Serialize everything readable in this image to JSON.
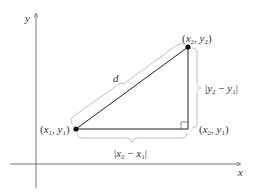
{
  "diagram": {
    "axes": {
      "x_label": "x",
      "y_label": "y"
    },
    "points": {
      "p1": {
        "label_open": "(",
        "x_base": "x",
        "x_sub": "1",
        "comma": ", ",
        "y_base": "y",
        "y_sub": "1",
        "label_close": ")"
      },
      "p2": {
        "label_open": "(",
        "x_base": "x",
        "x_sub": "2",
        "comma": ", ",
        "y_base": "y",
        "y_sub": "2",
        "label_close": ")"
      },
      "corner": {
        "label_open": "(",
        "x_base": "x",
        "x_sub": "2",
        "comma": ", ",
        "y_base": "y",
        "y_sub": "1",
        "label_close": ")"
      }
    },
    "hypotenuse_label": "d",
    "horizontal_label": {
      "bar_open": "|",
      "a_base": "x",
      "a_sub": "2",
      "minus": " − ",
      "b_base": "x",
      "b_sub": "1",
      "bar_close": "|"
    },
    "vertical_label": {
      "bar_open": "|",
      "a_base": "y",
      "a_sub": "2",
      "minus": " − ",
      "b_base": "y",
      "b_sub": "1",
      "bar_close": "|"
    },
    "colors": {
      "edge": "#222222",
      "axis": "#555555",
      "brace": "#b8b8b8",
      "text": "#333333"
    }
  }
}
